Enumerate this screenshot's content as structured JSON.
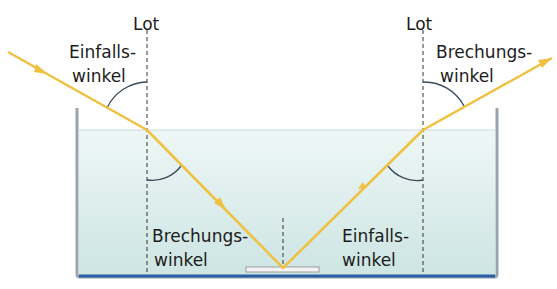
{
  "diagram": {
    "type": "refraction-reflection",
    "labels": {
      "lot_left": "Lot",
      "lot_right": "Lot",
      "incidence_top_line1": "Einfalls-",
      "incidence_top_line2": "winkel",
      "refraction_top_line1": "Brechungs-",
      "refraction_top_line2": "winkel",
      "refraction_bottom_line1": "Brechungs-",
      "refraction_bottom_line2": "winkel",
      "incidence_bottom_line1": "Einfalls-",
      "incidence_bottom_line2": "winkel"
    },
    "colors": {
      "ray": "#f0c040",
      "water_top": "#e8f4f3",
      "water_bottom": "#cfe6e4",
      "tank_bottom": "#2a5fa8",
      "arc": "#3a4a5a",
      "normal": "#333333"
    }
  }
}
